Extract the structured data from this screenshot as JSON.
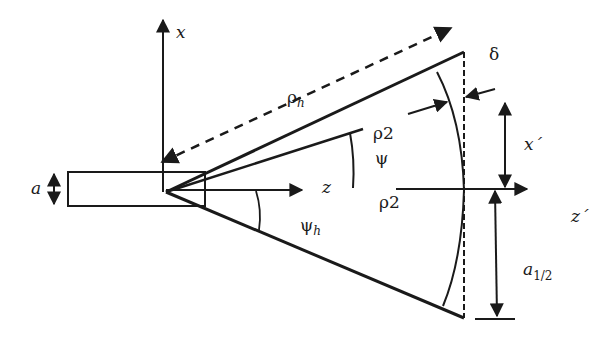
{
  "diagram": {
    "type": "E-plane sectoral horn geometry",
    "labels": {
      "x_axis": "x",
      "z_axis": "z",
      "x_prime": "x´",
      "z_prime": "z´",
      "rho_h": "ρ",
      "rho_h_sub": "h",
      "rho2_top": "ρ2",
      "rho2_bottom": "ρ2",
      "psi": "ψ",
      "psi_h": "ψ",
      "psi_h_sub": "h",
      "delta": "δ",
      "a": "a",
      "a_half": "a",
      "a_half_sub": "1/2"
    },
    "colors": {
      "stroke": "#1a1a1a",
      "background": "#ffffff"
    }
  }
}
